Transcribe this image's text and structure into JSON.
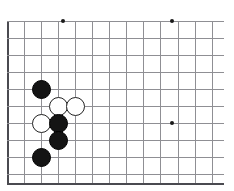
{
  "figure": {
    "kind": "go-board-diagram",
    "background_color": "#ffffff"
  },
  "board": {
    "grid_origin_x": 7,
    "grid_origin_y": 21,
    "grid_spacing": 17.05,
    "columns": 13,
    "rows": 10,
    "line_color": "#8f8f94",
    "edge_color": "#4a4a50",
    "left_edge_x": 7,
    "bottom_edge_y": 183,
    "right_extent_x": 224,
    "top_line_y": 21,
    "extra_partial_columns": 1
  },
  "star_points": [
    {
      "name": "star-point-upper-left",
      "col": 3,
      "row": 0,
      "x": 63,
      "y": 21
    },
    {
      "name": "star-point-upper-right",
      "col": 9,
      "row": 0,
      "x": 172,
      "y": 21
    },
    {
      "name": "star-point-lower-right",
      "col": 9,
      "row": 6,
      "x": 172,
      "y": 123
    }
  ],
  "stones": [
    {
      "color": "black",
      "col": 2,
      "row": 4,
      "x": 41,
      "y": 89,
      "label": "black-stone-1"
    },
    {
      "color": "white",
      "col": 3,
      "row": 5,
      "x": 58,
      "y": 106,
      "label": "white-stone-1"
    },
    {
      "color": "white",
      "col": 4,
      "row": 5,
      "x": 75,
      "y": 106,
      "label": "white-stone-2"
    },
    {
      "color": "white",
      "col": 2,
      "row": 6,
      "x": 41,
      "y": 123,
      "label": "white-stone-3"
    },
    {
      "color": "black",
      "col": 3,
      "row": 6,
      "x": 58,
      "y": 123,
      "label": "black-stone-2"
    },
    {
      "color": "black",
      "col": 3,
      "row": 7,
      "x": 58,
      "y": 140,
      "label": "black-stone-3"
    },
    {
      "color": "black",
      "col": 2,
      "row": 8,
      "x": 41,
      "y": 157,
      "label": "black-stone-4"
    }
  ],
  "colors": {
    "black_stone": "#141414",
    "white_stone": "#ffffff",
    "white_stone_outline": "#222222",
    "grid": "#8f8f94",
    "edge": "#4a4a50",
    "star": "#1a1a1a"
  }
}
